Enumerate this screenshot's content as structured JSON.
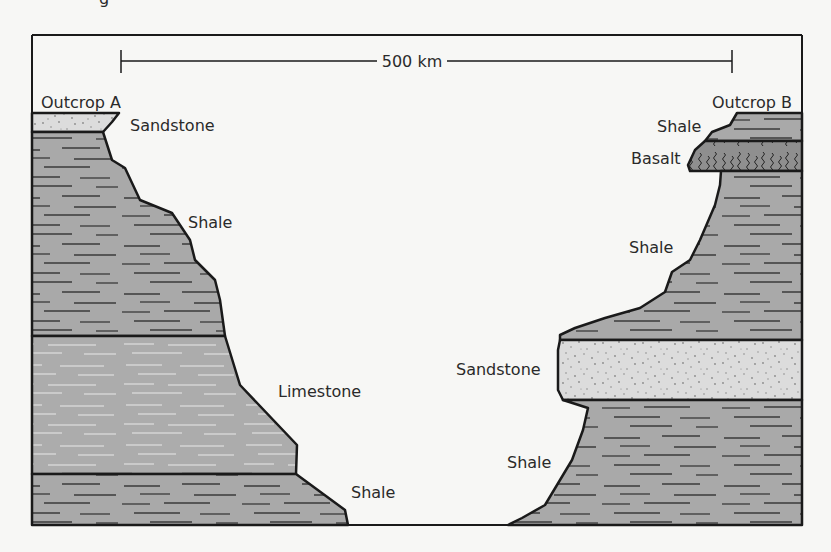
{
  "title_fragment": "g",
  "scale_bar": {
    "label": "500 km"
  },
  "outcrops": [
    {
      "name": "Outcrop A",
      "layers_top_to_bottom": [
        "Sandstone",
        "Shale",
        "Limestone",
        "Shale"
      ]
    },
    {
      "name": "Outcrop B",
      "layers_top_to_bottom": [
        "Shale",
        "Basalt",
        "Shale",
        "Sandstone",
        "Shale"
      ]
    }
  ],
  "labels": {
    "outcrop_a": "Outcrop A",
    "outcrop_b": "Outcrop B",
    "a_sandstone": "Sandstone",
    "a_shale_upper": "Shale",
    "a_limestone": "Limestone",
    "a_shale_lower": "Shale",
    "b_shale_top": "Shale",
    "b_basalt": "Basalt",
    "b_shale_mid": "Shale",
    "b_sandstone": "Sandstone",
    "b_shale_bottom": "Shale"
  },
  "colors": {
    "background": "#f7f7f5",
    "shale": "#a9a9a9",
    "limestone": "#acacac",
    "sandstone": "#dcdcdc",
    "basalt": "#8f8f8f",
    "outline": "#1a1a1a"
  }
}
